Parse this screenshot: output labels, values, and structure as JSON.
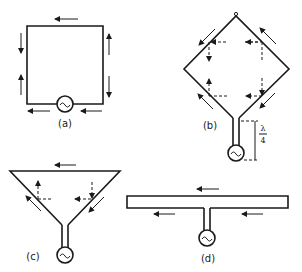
{
  "figure": {
    "panels": [
      {
        "id": "a",
        "label": "(a)",
        "shape": "square loop fed by source at bottom"
      },
      {
        "id": "b",
        "label": "(b)",
        "shape": "diamond (rhombic) loop fed by quarter-wave line",
        "annotation": {
          "numerator": "λ",
          "denominator": "4"
        }
      },
      {
        "id": "c",
        "label": "(c)",
        "shape": "inverted triangle fed by line"
      },
      {
        "id": "d",
        "label": "(d)",
        "shape": "T-shaped folded dipole fed at centre"
      }
    ],
    "source_symbol": "~",
    "colors": {
      "stroke": "#1a1a1a",
      "background": "#ffffff"
    }
  }
}
